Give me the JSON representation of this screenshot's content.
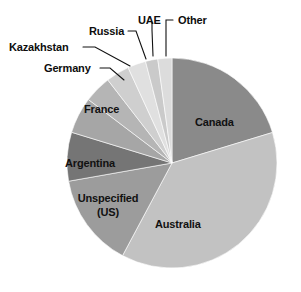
{
  "chart_data": {
    "type": "pie",
    "title": "",
    "subtitle": "",
    "xlabel": "",
    "ylabel": "",
    "legend_position": "none",
    "grid": false,
    "labels_shown_on_slices": true,
    "start_angle_deg": 0,
    "direction": "clockwise",
    "categories": [
      "Canada",
      "Australia",
      "Unspecified (US)",
      "Argentina",
      "France",
      "Germany",
      "Kazakhstan",
      "Russia",
      "UAE",
      "Other"
    ],
    "values": [
      20.3,
      37.5,
      14.4,
      7.5,
      5.6,
      4.2,
      3.6,
      2.8,
      1.9,
      2.2
    ],
    "units": "percent",
    "slices": [
      {
        "label": "Canada",
        "value": 20.3,
        "color": "#8a8a8a",
        "start_deg": 0.0,
        "end_deg": 73.1,
        "label_placement": "inside"
      },
      {
        "label": "Australia",
        "value": 37.5,
        "color": "#c2c2c2",
        "start_deg": 73.1,
        "end_deg": 208.1,
        "label_placement": "inside"
      },
      {
        "label": "Unspecified\n(US)",
        "value": 14.4,
        "color": "#9c9c9c",
        "start_deg": 208.1,
        "end_deg": 260.0,
        "label_placement": "inside"
      },
      {
        "label": "Argentina",
        "value": 7.5,
        "color": "#757575",
        "start_deg": 260.0,
        "end_deg": 287.0,
        "label_placement": "inside"
      },
      {
        "label": "France",
        "value": 5.6,
        "color": "#a6a6a6",
        "start_deg": 287.0,
        "end_deg": 307.2,
        "label_placement": "inside"
      },
      {
        "label": "Germany",
        "value": 4.2,
        "color": "#b5b5b5",
        "start_deg": 307.2,
        "end_deg": 322.3,
        "label_placement": "outside-leader"
      },
      {
        "label": "Kazakhstan",
        "value": 3.6,
        "color": "#cfcfcf",
        "start_deg": 322.3,
        "end_deg": 335.3,
        "label_placement": "outside-leader"
      },
      {
        "label": "Russia",
        "value": 2.8,
        "color": "#e0e0e0",
        "start_deg": 335.3,
        "end_deg": 345.4,
        "label_placement": "outside-leader"
      },
      {
        "label": "UAE",
        "value": 1.9,
        "color": "#cacaca",
        "start_deg": 345.4,
        "end_deg": 352.2,
        "label_placement": "outside-leader"
      },
      {
        "label": "Other",
        "value": 2.2,
        "color": "#dcdcdc",
        "start_deg": 352.2,
        "end_deg": 360.0,
        "label_placement": "outside-leader"
      }
    ],
    "geometry": {
      "center_x": 172,
      "center_y": 163,
      "radius": 105
    }
  },
  "labels": {
    "canada": "Canada",
    "australia": "Australia",
    "unspecified_line1": "Unspecified",
    "unspecified_line2": "(US)",
    "argentina": "Argentina",
    "france": "France",
    "germany": "Germany",
    "kazakhstan": "Kazakhstan",
    "russia": "Russia",
    "uae": "UAE",
    "other": "Other"
  },
  "colors": {
    "background": "#ffffff",
    "text": "#100f0f",
    "leader_line": "#111111",
    "canada": "#8a8a8a",
    "australia": "#c2c2c2",
    "unspecified": "#9c9c9c",
    "argentina": "#757575",
    "france": "#a6a6a6",
    "germany": "#b5b5b5",
    "kazakhstan": "#cfcfcf",
    "russia": "#e0e0e0",
    "uae": "#cacaca",
    "other": "#dcdcdc"
  }
}
